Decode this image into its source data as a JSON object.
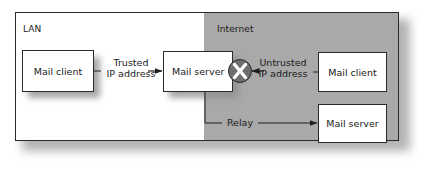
{
  "diagram": {
    "type": "network-relay-diagram",
    "regions": [
      {
        "id": "lan",
        "label": "LAN",
        "fill": "#ffffff"
      },
      {
        "id": "internet",
        "label": "Internet",
        "fill": "#a9a9a9"
      }
    ],
    "nodes": {
      "lan_mail_client": {
        "label": "Mail client",
        "region": "lan"
      },
      "lan_mail_server": {
        "label": "Mail server",
        "region": "lan"
      },
      "internet_mail_client": {
        "label": "Mail client",
        "region": "internet"
      },
      "internet_mail_server": {
        "label": "Mail server",
        "region": "internet"
      }
    },
    "edges": {
      "trusted": {
        "from": "lan_mail_client",
        "to": "lan_mail_server",
        "label_line1": "Trusted",
        "label_line2": "IP address",
        "allowed": true
      },
      "untrusted": {
        "from": "internet_mail_client",
        "to": "lan_mail_server",
        "label_line1": "Untrusted",
        "label_line2": "IP address",
        "allowed": false
      },
      "relay": {
        "from": "lan_mail_server",
        "to": "internet_mail_server",
        "label": "Relay",
        "allowed": true
      }
    },
    "blocked_icon": {
      "icon": "x-circle-icon",
      "glyph": "✕",
      "fill": "#6e6e6e",
      "mark_color": "#ffffff"
    },
    "colors": {
      "line": "#1f1f1f",
      "internet_fill": "#a9a9a9",
      "shadow": "#8f8f8f"
    }
  }
}
